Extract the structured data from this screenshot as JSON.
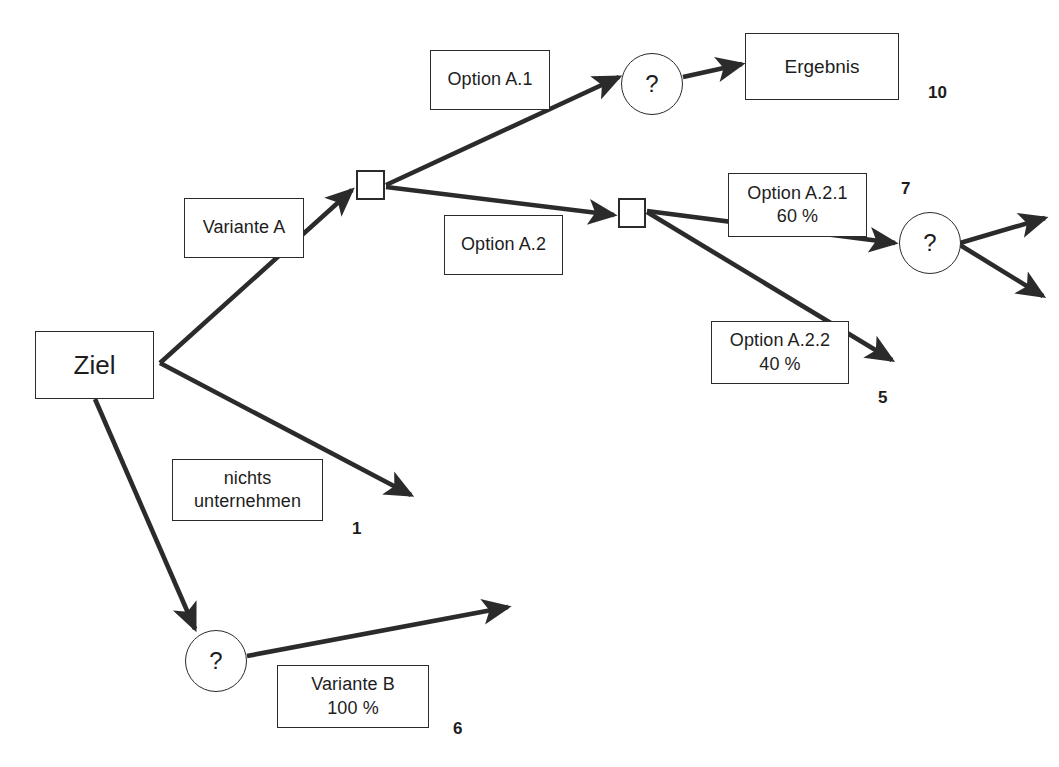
{
  "diagram": {
    "background_color": "#ffffff",
    "line_color": "#2b2b2b",
    "nodes": {
      "goal": {
        "label": "Ziel",
        "type": "decision-start",
        "x": 35,
        "y": 331,
        "w": 119,
        "h": 68
      },
      "decision_a": {
        "label": "",
        "type": "decision-square",
        "x": 356,
        "y": 170,
        "w": 29,
        "h": 30
      },
      "decision_a2": {
        "label": "",
        "type": "decision-square",
        "x": 618,
        "y": 198,
        "w": 28,
        "h": 30
      },
      "chance_a1": {
        "label": "?",
        "type": "chance-circle",
        "x": 621,
        "y": 53,
        "w": 62,
        "h": 62
      },
      "chance_a21": {
        "label": "?",
        "type": "chance-circle",
        "x": 899,
        "y": 212,
        "w": 62,
        "h": 62
      },
      "chance_b": {
        "label": "?",
        "type": "chance-circle",
        "x": 185,
        "y": 630,
        "w": 62,
        "h": 62
      },
      "result": {
        "label": "Ergebnis",
        "type": "result-box",
        "x": 745,
        "y": 33,
        "w": 154,
        "h": 67
      }
    },
    "edge_labels": [
      {
        "name": "variante-a",
        "line1": "Variante A",
        "line2": "",
        "x": 184,
        "y": 198,
        "w": 120,
        "h": 60
      },
      {
        "name": "option-a1",
        "line1": "Option A.1",
        "line2": "",
        "x": 430,
        "y": 50,
        "w": 120,
        "h": 60
      },
      {
        "name": "option-a2",
        "line1": "Option A.2",
        "line2": "",
        "x": 444,
        "y": 215,
        "w": 119,
        "h": 60
      },
      {
        "name": "option-a21",
        "line1": "Option A.2.1",
        "line2": "60 %",
        "x": 728,
        "y": 173,
        "w": 139,
        "h": 64
      },
      {
        "name": "option-a22",
        "line1": "Option A.2.2",
        "line2": "40 %",
        "x": 711,
        "y": 321,
        "w": 138,
        "h": 63
      },
      {
        "name": "nichts-unternehmen",
        "line1": "nichts",
        "line2": "unternehmen",
        "x": 172,
        "y": 459,
        "w": 151,
        "h": 62
      },
      {
        "name": "variante-b",
        "line1": "Variante B",
        "line2": "100 %",
        "x": 277,
        "y": 665,
        "w": 152,
        "h": 63
      }
    ],
    "payoffs": [
      {
        "name": "payoff-ergebnis",
        "value": "10",
        "x": 928,
        "y": 83
      },
      {
        "name": "payoff-a21",
        "value": "7",
        "x": 901,
        "y": 179
      },
      {
        "name": "payoff-a22",
        "value": "5",
        "x": 878,
        "y": 388
      },
      {
        "name": "payoff-nichts",
        "value": "1",
        "x": 352,
        "y": 519
      },
      {
        "name": "payoff-variante-b",
        "value": "6",
        "x": 453,
        "y": 719
      }
    ],
    "edges": [
      {
        "name": "edge-goal-to-decision-a",
        "from": "goal",
        "to": "decision_a",
        "x1": 160,
        "y1": 363,
        "x2": 352,
        "y2": 190,
        "arrow": true
      },
      {
        "name": "edge-goal-to-nichts",
        "from": "goal",
        "to": "payoff-nichts",
        "x1": 160,
        "y1": 363,
        "x2": 411,
        "y2": 495,
        "arrow": true
      },
      {
        "name": "edge-goal-to-chance-b",
        "from": "goal",
        "to": "chance_b",
        "x1": 95,
        "y1": 399,
        "x2": 195,
        "y2": 629,
        "arrow": true
      },
      {
        "name": "edge-decision-a-to-chance-a1",
        "from": "decision_a",
        "to": "chance_a1",
        "x1": 386,
        "y1": 185,
        "x2": 619,
        "y2": 77,
        "arrow": true
      },
      {
        "name": "edge-decision-a-to-decision-a2",
        "from": "decision_a",
        "to": "decision_a2",
        "x1": 386,
        "y1": 187,
        "x2": 614,
        "y2": 215,
        "arrow": true
      },
      {
        "name": "edge-chance-a1-to-result",
        "from": "chance_a1",
        "to": "result",
        "x1": 683,
        "y1": 77,
        "x2": 742,
        "y2": 64,
        "arrow": true
      },
      {
        "name": "edge-decision-a2-to-chance-a21",
        "from": "decision_a2",
        "to": "chance_a21",
        "x1": 647,
        "y1": 211,
        "x2": 895,
        "y2": 243,
        "arrow": true
      },
      {
        "name": "edge-decision-a2-to-payoff-a22",
        "from": "decision_a2",
        "to": "payoff-a22",
        "x1": 647,
        "y1": 212,
        "x2": 892,
        "y2": 360,
        "arrow": true
      },
      {
        "name": "edge-chance-a21-branch-up",
        "from": "chance_a21",
        "to": "open-up",
        "x1": 960,
        "y1": 243,
        "x2": 1045,
        "y2": 218,
        "arrow": true
      },
      {
        "name": "edge-chance-a21-branch-down",
        "from": "chance_a21",
        "to": "open-down",
        "x1": 960,
        "y1": 245,
        "x2": 1043,
        "y2": 296,
        "arrow": true
      },
      {
        "name": "edge-chance-b-to-open",
        "from": "chance_b",
        "to": "open-right",
        "x1": 247,
        "y1": 656,
        "x2": 508,
        "y2": 607,
        "arrow": true
      }
    ]
  }
}
